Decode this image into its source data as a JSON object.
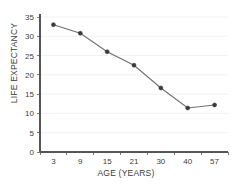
{
  "chart_data": {
    "type": "line",
    "title": "",
    "xlabel": "AGE (YEARS)",
    "ylabel": "LIFE EXPECTANCY",
    "categories": [
      "3",
      "9",
      "15",
      "21",
      "30",
      "40",
      "57"
    ],
    "values": [
      33,
      30.8,
      26,
      22.5,
      16.6,
      11.4,
      12.2
    ],
    "ylim": [
      0,
      35
    ],
    "yticks": [
      "0",
      "5",
      "10",
      "15",
      "20",
      "25",
      "30",
      "35"
    ],
    "ytick_values": [
      0,
      5,
      10,
      15,
      20,
      25,
      30,
      35
    ],
    "grid": true,
    "legend": "none",
    "marker": "circle",
    "series": [
      {
        "name": "Life expectancy",
        "values": [
          33,
          30.8,
          26,
          22.5,
          16.6,
          11.4,
          12.2
        ]
      }
    ],
    "colors": {
      "line": "#6f6f6f",
      "marker": "#3b3b3b",
      "grid": "#f2f2f4",
      "axis": "#555555",
      "text": "#3c3c3c",
      "background": "#ffffff"
    }
  }
}
